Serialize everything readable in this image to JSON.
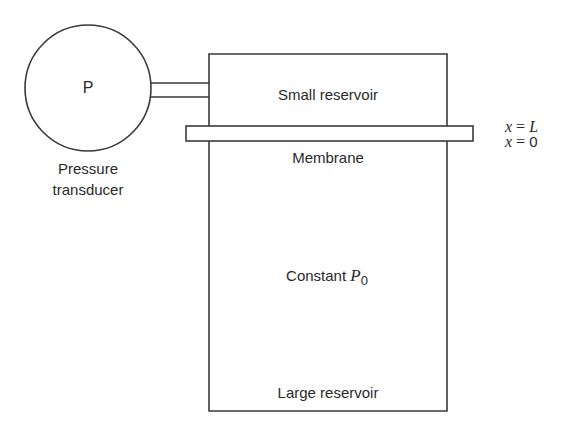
{
  "diagram": {
    "transducer": {
      "symbol": "P",
      "label_line1": "Pressure",
      "label_line2": "transducer"
    },
    "small_reservoir": {
      "label": "Small reservoir"
    },
    "membrane": {
      "label": "Membrane"
    },
    "large_reservoir": {
      "constant_label": "Constant",
      "pressure_symbol": "P",
      "pressure_subscript": "0",
      "label": "Large reservoir"
    },
    "coordinates": {
      "top_var": "x",
      "top_eq": " = ",
      "top_val": "L",
      "bottom_var": "x",
      "bottom_eq": " = ",
      "bottom_val": "0"
    },
    "colors": {
      "stroke": "#3a3a3a",
      "text": "#2a2a2a",
      "background": "#ffffff"
    }
  }
}
